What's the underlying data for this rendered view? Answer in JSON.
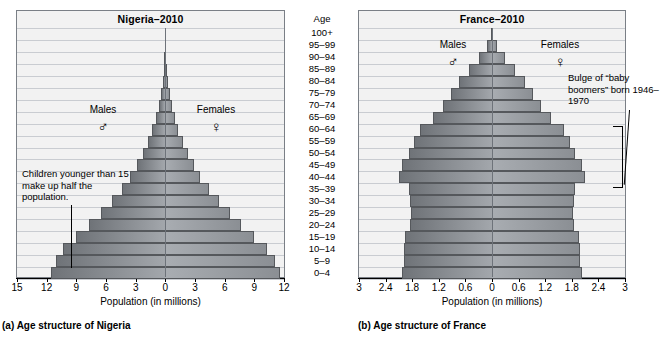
{
  "figure": {
    "axis_title": "Population (in millions)",
    "age_header": "Age",
    "age_groups": [
      "100+",
      "95–99",
      "90–94",
      "85–89",
      "80–84",
      "75–79",
      "70–74",
      "65–69",
      "60–64",
      "55–59",
      "50–54",
      "45–49",
      "40–44",
      "35–39",
      "30–34",
      "25–29",
      "20–24",
      "15–19",
      "10–14",
      "5–9",
      "0–4"
    ],
    "males_label": "Males",
    "females_label": "Females",
    "male_symbol": "♂",
    "female_symbol": "♀",
    "colors": {
      "male_bar": "#7c8085",
      "female_bar": "#9da1a6",
      "panel_bg": "#f2f2f2",
      "gridline": "#c9ccd1",
      "axis": "#000000"
    }
  },
  "panels": [
    {
      "id": "nigeria",
      "title": "Nigeria–2010",
      "caption": "(a) Age structure of Nigeria",
      "annotation": "Children younger than 15 make up half the population.",
      "xticks": [
        "15",
        "12",
        "9",
        "6",
        "3",
        "0",
        "3",
        "6",
        "9",
        "12"
      ],
      "xtick_values": [
        -15,
        -12,
        -9,
        -6,
        -3,
        0,
        3,
        6,
        9,
        12
      ]
    },
    {
      "id": "france",
      "title": "France–2010",
      "caption": "(b) Age structure of France",
      "annotation": "Bulge of “baby boomers” born 1946–1970",
      "xticks": [
        "3",
        "2.4",
        "1.8",
        "1.2",
        "0.6",
        "0",
        "0.6",
        "1.2",
        "1.8",
        "2.4",
        "3"
      ],
      "xtick_values": [
        -3,
        -2.4,
        -1.8,
        -1.2,
        -0.6,
        0,
        0.6,
        1.2,
        1.8,
        2.4,
        3
      ]
    }
  ],
  "chart_data": [
    {
      "type": "bar",
      "orientation": "population-pyramid",
      "title": "Nigeria–2010",
      "xlabel": "Population (in millions)",
      "ylabel": "Age",
      "xlim": [
        -15,
        12
      ],
      "grid": true,
      "categories": [
        "100+",
        "95–99",
        "90–94",
        "85–89",
        "80–84",
        "75–79",
        "70–74",
        "65–69",
        "60–64",
        "55–59",
        "50–54",
        "45–49",
        "40–44",
        "35–39",
        "30–34",
        "25–29",
        "20–24",
        "15–19",
        "10–14",
        "5–9",
        "0–4"
      ],
      "series": [
        {
          "name": "Males",
          "side": "left",
          "values": [
            0.02,
            0.05,
            0.09,
            0.16,
            0.28,
            0.45,
            0.68,
            0.95,
            1.3,
            1.75,
            2.25,
            2.85,
            3.55,
            4.4,
            5.4,
            6.5,
            7.7,
            9.0,
            10.3,
            11.1,
            11.6
          ]
        },
        {
          "name": "Females",
          "side": "right",
          "values": [
            0.02,
            0.05,
            0.09,
            0.16,
            0.28,
            0.45,
            0.68,
            0.95,
            1.3,
            1.75,
            2.25,
            2.85,
            3.55,
            4.4,
            5.4,
            6.5,
            7.7,
            9.0,
            10.3,
            11.1,
            11.6
          ]
        }
      ]
    },
    {
      "type": "bar",
      "orientation": "population-pyramid",
      "title": "France–2010",
      "xlabel": "Population (in millions)",
      "ylabel": "Age",
      "xlim": [
        -3,
        3
      ],
      "grid": true,
      "categories": [
        "100+",
        "95–99",
        "90–94",
        "85–89",
        "80–84",
        "75–79",
        "70–74",
        "65–69",
        "60–64",
        "55–59",
        "50–54",
        "45–49",
        "40–44",
        "35–39",
        "30–34",
        "25–29",
        "20–24",
        "15–19",
        "10–14",
        "5–9",
        "0–4"
      ],
      "series": [
        {
          "name": "Males",
          "side": "left",
          "values": [
            0.03,
            0.12,
            0.3,
            0.52,
            0.74,
            0.92,
            1.1,
            1.32,
            1.62,
            1.76,
            1.88,
            2.02,
            2.1,
            1.88,
            1.86,
            1.82,
            1.86,
            1.96,
            1.98,
            1.98,
            2.02
          ]
        },
        {
          "name": "Females",
          "side": "right",
          "values": [
            0.03,
            0.12,
            0.3,
            0.52,
            0.74,
            0.92,
            1.1,
            1.32,
            1.62,
            1.76,
            1.88,
            2.02,
            2.1,
            1.88,
            1.86,
            1.82,
            1.86,
            1.96,
            1.98,
            1.98,
            2.02
          ]
        }
      ]
    }
  ]
}
